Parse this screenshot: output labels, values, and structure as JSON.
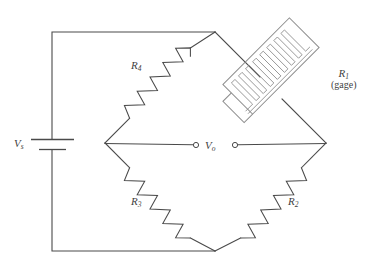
{
  "figure": {
    "type": "circuit-diagram",
    "name": "Wheatstone bridge with strain gage",
    "background_color": "#ffffff",
    "line_color": "#4a4a4a",
    "gage_color": "#8c8c8c"
  },
  "labels": {
    "source": {
      "symbol": "V",
      "subscript": "s"
    },
    "output": {
      "symbol": "V",
      "subscript": "o"
    },
    "r1": {
      "symbol": "R",
      "subscript": "1",
      "note": "(gage)"
    },
    "r2": {
      "symbol": "R",
      "subscript": "2"
    },
    "r3": {
      "symbol": "R",
      "subscript": "3"
    },
    "r4": {
      "symbol": "R",
      "subscript": "4"
    }
  },
  "components": [
    {
      "id": "battery",
      "name": "voltage-source",
      "label": "Vs",
      "kind": "battery"
    },
    {
      "id": "r1",
      "name": "strain-gage-resistor",
      "label": "R1",
      "kind": "strain-gage"
    },
    {
      "id": "r2",
      "name": "resistor-r2",
      "label": "R2",
      "kind": "resistor"
    },
    {
      "id": "r3",
      "name": "resistor-r3",
      "label": "R3",
      "kind": "resistor"
    },
    {
      "id": "r4",
      "name": "resistor-r4",
      "label": "R4",
      "kind": "resistor"
    },
    {
      "id": "vo",
      "name": "output-terminals",
      "label": "Vo",
      "kind": "terminal-pair"
    }
  ],
  "nodes": {
    "top": [
      215,
      32
    ],
    "bottom": [
      215,
      251
    ],
    "left": [
      105,
      143
    ],
    "right": [
      326,
      143
    ],
    "outer_top_left": [
      52,
      31
    ],
    "outer_bottom_left": [
      52,
      251
    ]
  },
  "terminals": {
    "left_terminal": [
      196,
      145
    ],
    "right_terminal": [
      235,
      145
    ],
    "radius": 2.6
  }
}
